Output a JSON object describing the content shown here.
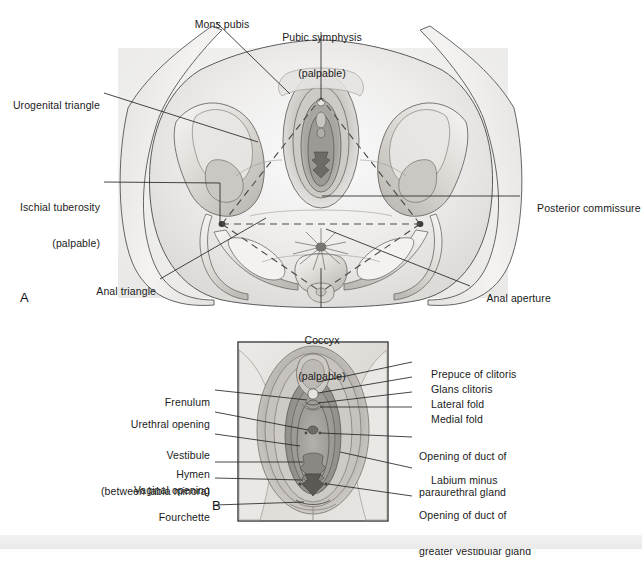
{
  "figure": {
    "panels": [
      {
        "id": "A",
        "label": "A"
      },
      {
        "id": "B",
        "label": "B"
      }
    ]
  },
  "colors": {
    "line": "#2b2b2b",
    "text": "#1b1b1b",
    "skin_light": "#f0efed",
    "skin_mid": "#d8d6d3",
    "skin_dark": "#a9a6a3",
    "bone_light": "#efeeec",
    "bone_mid": "#cfccc8",
    "bone_shadow": "#b3afab",
    "frame": "#3a3a3a",
    "footer_band": "#ededed"
  },
  "panel_a": {
    "id": "A",
    "label": "A",
    "labels": [
      {
        "key": "mons_pubis",
        "text": "Mons pubis",
        "align": "center"
      },
      {
        "key": "pubic_symphysis",
        "text": "Pubic symphysis",
        "sub": "(palpable)",
        "align": "center"
      },
      {
        "key": "urogenital_triangle",
        "text": "Urogenital triangle",
        "align": "right"
      },
      {
        "key": "ischial_tuberosity",
        "text": "Ischial tuberosity",
        "sub": "(palpable)",
        "align": "right"
      },
      {
        "key": "anal_triangle",
        "text": "Anal triangle",
        "align": "right"
      },
      {
        "key": "posterior_commissure",
        "text": "Posterior commissure",
        "align": "left"
      },
      {
        "key": "anal_aperture",
        "text": "Anal aperture",
        "align": "left"
      },
      {
        "key": "coccyx",
        "text": "Coccyx",
        "sub": "(palpable)",
        "align": "center"
      }
    ]
  },
  "panel_b": {
    "id": "B",
    "label": "B",
    "labels_left": [
      {
        "key": "frenulum",
        "text": "Frenulum"
      },
      {
        "key": "urethral_opening",
        "text": "Urethral opening"
      },
      {
        "key": "vestibule",
        "text": "Vestibule",
        "sub": "(between labia minora)"
      },
      {
        "key": "hymen",
        "text": "Hymen"
      },
      {
        "key": "vaginal_opening",
        "text": "Vaginal opening"
      },
      {
        "key": "fourchette",
        "text": "Fourchette"
      }
    ],
    "labels_right": [
      {
        "key": "prepuce_of_clitoris",
        "text": "Prepuce of clitoris"
      },
      {
        "key": "glans_clitoris",
        "text": "Glans clitoris"
      },
      {
        "key": "lateral_fold",
        "text": "Lateral fold"
      },
      {
        "key": "medial_fold",
        "text": "Medial fold"
      },
      {
        "key": "opening_paraurethral",
        "text": "Opening of duct of",
        "sub": "paraurethral gland"
      },
      {
        "key": "labium_minus",
        "text": "Labium minus"
      },
      {
        "key": "opening_greater_vestibular",
        "text": "Opening of duct of",
        "sub": "greater vestibular gland"
      }
    ]
  }
}
